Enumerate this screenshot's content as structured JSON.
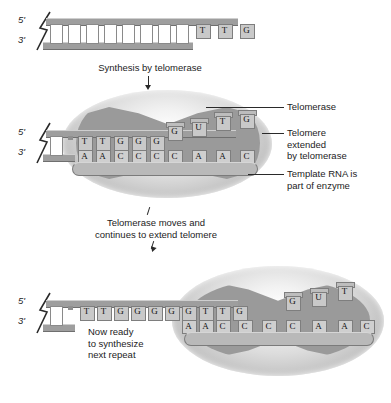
{
  "figure": {
    "background_color": "#ffffff",
    "strand_color": "#9e9e9e",
    "enzyme_color": "#9a9a9a"
  },
  "panels": {
    "top": {
      "name": "Telomere before extension",
      "five_prime": "5'",
      "three_prime": "3'",
      "duplex_rungs": 8,
      "overhang_bases": [
        "T",
        "T",
        "G"
      ]
    },
    "middle": {
      "name": "Telomerase bound and extending telomere",
      "five_prime": "5'",
      "three_prime": "3'",
      "duplex_rungs": 2,
      "dna_top_bases": [
        "T",
        "T",
        "G",
        "G",
        "G"
      ],
      "rna_bottom_bases": [
        "A",
        "A",
        "C",
        "C",
        "C",
        "C",
        "A",
        "A",
        "C"
      ],
      "incoming_bases": [
        "G",
        "U",
        "T",
        "G"
      ]
    },
    "bottom": {
      "name": "Telomere ready for next repeat",
      "five_prime": "5'",
      "three_prime": "3'",
      "duplex_rungs": 2,
      "dna_top_bases": [
        "T",
        "T",
        "G",
        "G",
        "G",
        "G",
        "G",
        "T",
        "T",
        "G"
      ],
      "rna_bottom_bases": [
        "A",
        "A",
        "C",
        "C",
        "C",
        "C",
        "A",
        "A",
        "C"
      ],
      "incoming_bases": [
        "G",
        "U",
        "T"
      ]
    }
  },
  "captions": {
    "synthesis": "Synthesis by telomerase",
    "moves": "Telomerase moves and\ncontinues to extend telomere",
    "ready": "Now ready\nto synthesize\nnext repeat"
  },
  "labels": {
    "telomerase": "Telomerase",
    "telomere_extended": "Telomere\nextended\nby telomerase",
    "template_rna": "Template RNA is\npart of enzyme"
  }
}
